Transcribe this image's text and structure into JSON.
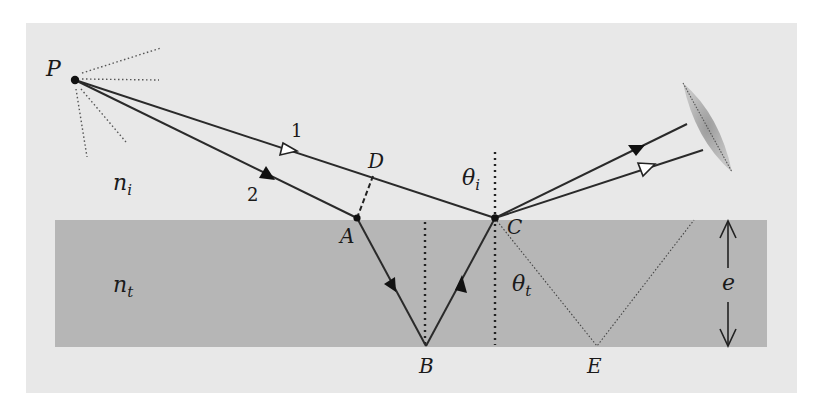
{
  "diagram": {
    "type": "optics-thin-film-interference",
    "colors": {
      "background": "#e8e8e8",
      "slab": "#b4b4b4",
      "ray": "#2a2a2a",
      "lens": "#a8a8a8"
    },
    "labels": {
      "source": "P",
      "ray1": "1",
      "ray2": "2",
      "point_D": "D",
      "point_A": "A",
      "point_B": "B",
      "point_C": "C",
      "point_E": "E",
      "medium_incident": "n",
      "medium_incident_sub": "i",
      "medium_transmitted": "n",
      "medium_transmitted_sub": "t",
      "angle_incident": "θ",
      "angle_incident_sub": "i",
      "angle_transmitted": "θ",
      "angle_transmitted_sub": "t",
      "thickness": "e"
    },
    "points": {
      "P": [
        75,
        80
      ],
      "A": [
        357,
        218
      ],
      "B": [
        426,
        346
      ],
      "C": [
        495,
        218
      ],
      "D": [
        371,
        178
      ],
      "E": [
        597,
        346
      ]
    },
    "elements": [
      "point source P with dotted emission rays",
      "ray 1 (open arrow) from P to C reflecting toward lens",
      "ray 2 (filled arrow) from P to A, refracting to B, reflecting to C, exiting toward lens",
      "dashed line A-D perpendicular to ray 1",
      "dotted normals at B and C",
      "dotted continuation C-E-up",
      "thickness arrow e",
      "converging lens"
    ]
  }
}
